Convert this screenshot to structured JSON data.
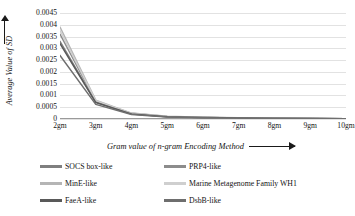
{
  "chart_data": {
    "type": "line",
    "title": "",
    "xlabel": "Gram value of n-gram Encoding Method",
    "ylabel": "Average Value of SD",
    "categories": [
      "2gm",
      "3gm",
      "4gm",
      "5gm",
      "6gm",
      "7gm",
      "8gm",
      "9gm",
      "10gm"
    ],
    "x": [
      2,
      3,
      4,
      5,
      6,
      7,
      8,
      9,
      10
    ],
    "ylim": [
      0,
      0.0045
    ],
    "yticks": [
      0,
      0.0005,
      0.001,
      0.0015,
      0.002,
      0.0025,
      0.003,
      0.0035,
      0.004,
      0.0045
    ],
    "ytick_labels": [
      "0",
      "0.0005",
      "0.001",
      "0.0015",
      "0.002",
      "0.0025",
      "0.003",
      "0.0035",
      "0.004",
      "0.0045"
    ],
    "grid": true,
    "legend_position": "bottom",
    "legend_columns": 2,
    "series": [
      {
        "name": "SOCS box-like",
        "color": "#7f7f7f",
        "values": [
          0.0033,
          0.00072,
          0.00022,
          0.0001,
          6e-05,
          4e-05,
          3e-05,
          2e-05,
          1e-05
        ]
      },
      {
        "name": "PRP4-like",
        "color": "#8c8c8c",
        "values": [
          0.0036,
          0.00076,
          0.00024,
          0.00011,
          7e-05,
          4e-05,
          3e-05,
          2e-05,
          1e-05
        ]
      },
      {
        "name": "MinE-like",
        "color": "#b5b5b5",
        "values": [
          0.0039,
          0.0008,
          0.00025,
          0.00012,
          7e-05,
          5e-05,
          3e-05,
          2e-05,
          1e-05
        ]
      },
      {
        "name": "Marine Metagenome Family WH1",
        "color": "#cfcfcf",
        "values": [
          0.00375,
          0.00078,
          0.00024,
          0.00011,
          7e-05,
          4e-05,
          3e-05,
          2e-05,
          1e-05
        ]
      },
      {
        "name": "FaeA-like",
        "color": "#595959",
        "values": [
          0.0032,
          0.0007,
          0.00021,
          0.0001,
          6e-05,
          4e-05,
          3e-05,
          2e-05,
          1e-05
        ]
      },
      {
        "name": "DsbB-like",
        "color": "#6e6e6e",
        "values": [
          0.0027,
          0.00062,
          0.00019,
          9e-05,
          5e-05,
          4e-05,
          2e-05,
          2e-05,
          1e-05
        ]
      }
    ]
  },
  "axes": {
    "y_axis_title": "Average Value of SD",
    "x_axis_title": "Gram value of n-gram Encoding Method"
  }
}
